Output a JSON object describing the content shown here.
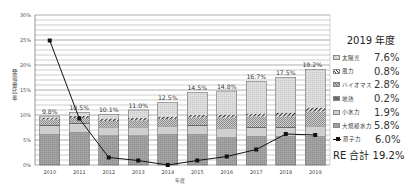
{
  "chart_data": {
    "type": "bar",
    "stacked": true,
    "title": "",
    "xlabel": "年度",
    "ylabel": "発電量比率",
    "ylim": [
      0,
      30
    ],
    "yticks": [
      "0%",
      "5%",
      "10%",
      "15%",
      "20%",
      "25%",
      "30%"
    ],
    "grid": true,
    "legend_position": "right",
    "categories": [
      "2010",
      "2011",
      "2012",
      "2013",
      "2014",
      "2015",
      "2016",
      "2017",
      "2018",
      "2019"
    ],
    "bar_totals": [
      9.8,
      10.5,
      10.1,
      11.0,
      12.5,
      14.5,
      14.8,
      16.7,
      17.5,
      19.2
    ],
    "bar_total_labels": [
      "9.8%",
      "10.5%",
      "10.1%",
      "11.0%",
      "12.5%",
      "14.5%",
      "14.8%",
      "16.7%",
      "17.5%",
      "19.2%"
    ],
    "series": [
      {
        "name": "大規模水力",
        "type": "bar",
        "values": [
          6.3,
          6.7,
          6.0,
          6.0,
          6.3,
          6.2,
          5.7,
          5.8,
          5.8,
          5.8
        ],
        "color": "#9a9a9a"
      },
      {
        "name": "小水力",
        "type": "bar",
        "values": [
          1.5,
          1.5,
          1.5,
          1.5,
          1.4,
          1.6,
          1.6,
          1.6,
          1.6,
          1.9
        ],
        "color": "#cfcfcf"
      },
      {
        "name": "地熱",
        "type": "bar",
        "values": [
          0.3,
          0.2,
          0.2,
          0.2,
          0.2,
          0.2,
          0.2,
          0.2,
          0.2,
          0.2
        ],
        "color": "#6e6e6e"
      },
      {
        "name": "バイオマス",
        "type": "bar",
        "values": [
          1.0,
          1.0,
          1.1,
          1.2,
          1.3,
          1.5,
          2.0,
          2.1,
          2.1,
          2.8
        ],
        "color": "#bdbdbd"
      },
      {
        "name": "風力",
        "type": "bar",
        "values": [
          0.4,
          0.4,
          0.5,
          0.5,
          0.5,
          0.5,
          0.6,
          0.6,
          0.7,
          0.8
        ],
        "color": "#ffffff"
      },
      {
        "name": "太陽光",
        "type": "bar",
        "values": [
          0.3,
          0.7,
          0.8,
          1.6,
          2.8,
          4.5,
          4.7,
          6.4,
          7.1,
          7.6
        ],
        "color": "#d9d9d9"
      },
      {
        "name": "原子力",
        "type": "line",
        "values": [
          24.9,
          9.3,
          1.5,
          0.9,
          0.0,
          0.9,
          1.7,
          3.1,
          6.2,
          6.0
        ],
        "color": "#111111"
      }
    ]
  },
  "legend": {
    "title": "2019 年度",
    "items": [
      {
        "name": "太陽光",
        "value": "7.6%",
        "swatch": "solar"
      },
      {
        "name": "風力",
        "value": "0.8%",
        "swatch": "wind"
      },
      {
        "name": "バイオマス",
        "value": "2.8%",
        "swatch": "biomass"
      },
      {
        "name": "地熱",
        "value": "0.2%",
        "swatch": "geo"
      },
      {
        "name": "小水力",
        "value": "1.9%",
        "swatch": "smallhydro"
      },
      {
        "name": "大規模水力",
        "value": "5.8%",
        "swatch": "largehydro"
      },
      {
        "name": "原子力",
        "value": "6.0%",
        "swatch": "nuclear"
      }
    ],
    "total": "RE 合計 19.2%"
  }
}
